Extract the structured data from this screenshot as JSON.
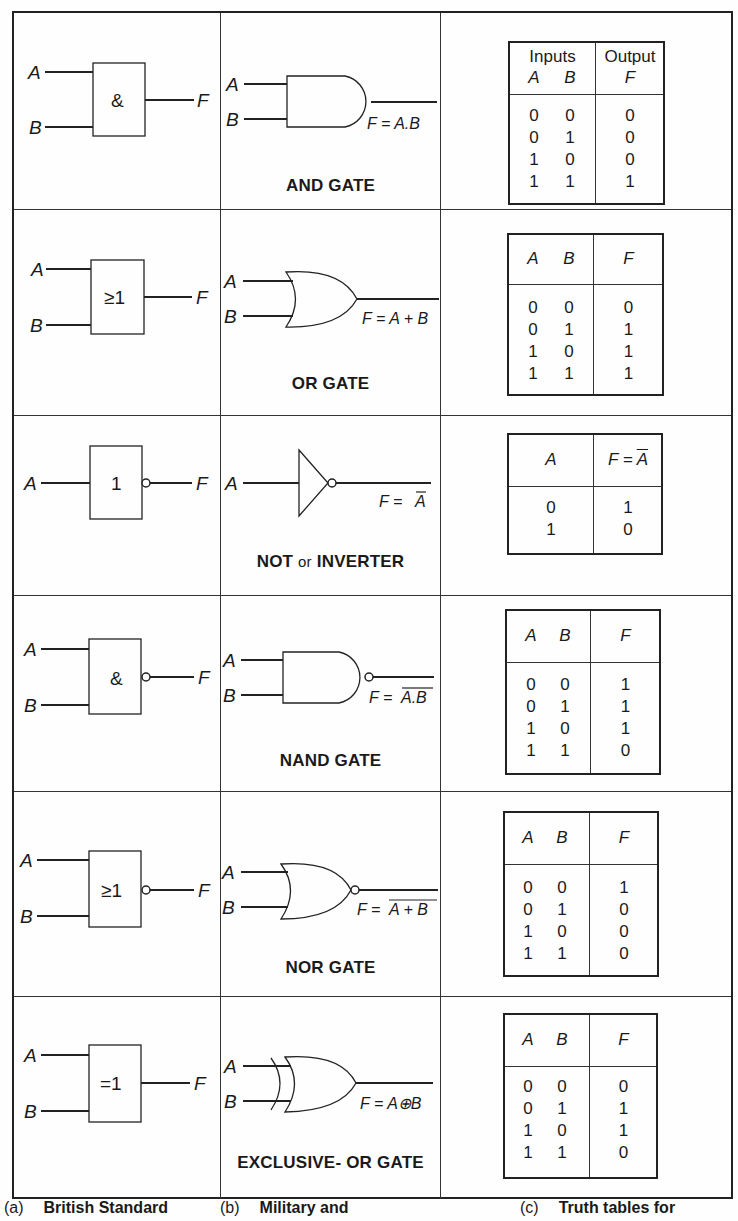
{
  "figure": {
    "columns": [
      {
        "tag": "(a)",
        "label": "British Standard"
      },
      {
        "tag": "(b)",
        "label": "Military and"
      },
      {
        "tag": "(c)",
        "label": "Truth tables for"
      }
    ],
    "gates": [
      {
        "id": "and",
        "name": "AND GATE",
        "bs_symbol": "&",
        "input_a": "A",
        "input_b": "B",
        "output": "F",
        "expression": "F = A.B",
        "truth_table": {
          "header_top_left": "Inputs",
          "header_top_right": "Output",
          "headers": [
            "A",
            "B",
            "F"
          ],
          "col_a": "0\n0\n1\n1",
          "col_b": "0\n1\n0\n1",
          "col_f": "0\n0\n0\n1"
        }
      },
      {
        "id": "or",
        "name": "OR GATE",
        "bs_symbol": "≥1",
        "input_a": "A",
        "input_b": "B",
        "output": "F",
        "expression": "F = A + B",
        "truth_table": {
          "headers": [
            "A",
            "B",
            "F"
          ],
          "col_a": "0\n0\n1\n1",
          "col_b": "0\n1\n0\n1",
          "col_f": "0\n1\n1\n1"
        }
      },
      {
        "id": "not",
        "name_main": "NOT",
        "name_or": "or",
        "name_alt": "INVERTER",
        "bs_symbol": "1",
        "input_a": "A",
        "output": "F",
        "expression_prefix": "F = ",
        "expression_overbar": "A",
        "truth_table": {
          "header_a": "A",
          "header_f_prefix": "F = ",
          "header_f_overbar": "A",
          "col_a": "0\n1",
          "col_f": "1\n0"
        }
      },
      {
        "id": "nand",
        "name": "NAND GATE",
        "bs_symbol": "&",
        "input_a": "A",
        "input_b": "B",
        "output": "F",
        "expression_prefix": "F = ",
        "expression_overbar": "A.B",
        "truth_table": {
          "headers": [
            "A",
            "B",
            "F"
          ],
          "col_a": "0\n0\n1\n1",
          "col_b": "0\n1\n0\n1",
          "col_f": "1\n1\n1\n0"
        }
      },
      {
        "id": "nor",
        "name": "NOR GATE",
        "bs_symbol": "≥1",
        "input_a": "A",
        "input_b": "B",
        "output": "F",
        "expression_prefix": "F = ",
        "expression_overbar": "A + B",
        "truth_table": {
          "headers": [
            "A",
            "B",
            "F"
          ],
          "col_a": "0\n0\n1\n1",
          "col_b": "0\n1\n0\n1",
          "col_f": "1\n0\n0\n0"
        }
      },
      {
        "id": "xor",
        "name": "EXCLUSIVE- OR GATE",
        "bs_symbol": "=1",
        "input_a": "A",
        "input_b": "B",
        "output": "F",
        "expression": "F = A⊕B",
        "truth_table": {
          "headers": [
            "A",
            "B",
            "F"
          ],
          "col_a": "0\n0\n1\n1",
          "col_b": "0\n1\n0\n1",
          "col_f": "0\n1\n1\n0"
        }
      }
    ]
  }
}
